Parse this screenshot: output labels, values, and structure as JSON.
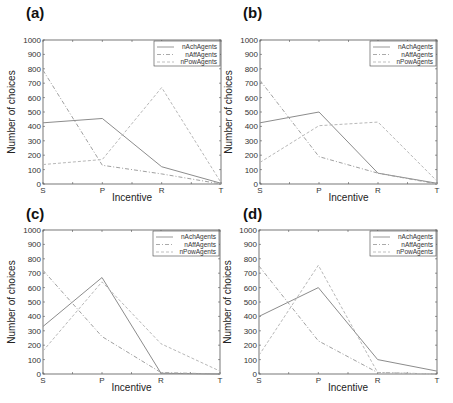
{
  "figure": {
    "panels": [
      "(a)",
      "(b)",
      "(c)",
      "(d)"
    ]
  },
  "chart_data": [
    {
      "panel": "(a)",
      "type": "line",
      "title": "",
      "xlabel": "Incentive",
      "ylabel": "Number of choices",
      "categories": [
        "S",
        "P",
        "R",
        "T"
      ],
      "ylim": [
        0,
        1000
      ],
      "yticks": [
        0,
        100,
        200,
        300,
        400,
        500,
        600,
        700,
        800,
        900,
        1000
      ],
      "grid": false,
      "legend_position": "upper right",
      "series": [
        {
          "name": "nAchAgents",
          "style": "solid",
          "values": [
            425,
            455,
            120,
            5
          ]
        },
        {
          "name": "nAffAgents",
          "style": "dash-dot",
          "values": [
            790,
            130,
            70,
            0
          ]
        },
        {
          "name": "nPowAgents",
          "style": "dashed",
          "values": [
            135,
            170,
            670,
            10
          ]
        }
      ]
    },
    {
      "panel": "(b)",
      "type": "line",
      "title": "",
      "xlabel": "Incentive",
      "ylabel": "Number of choices",
      "categories": [
        "S",
        "P",
        "R",
        "T"
      ],
      "ylim": [
        0,
        1000
      ],
      "yticks": [
        0,
        100,
        200,
        300,
        400,
        500,
        600,
        700,
        800,
        900,
        1000
      ],
      "grid": false,
      "legend_position": "upper right",
      "series": [
        {
          "name": "nAchAgents",
          "style": "solid",
          "values": [
            425,
            500,
            75,
            5
          ]
        },
        {
          "name": "nAffAgents",
          "style": "dash-dot",
          "values": [
            720,
            190,
            75,
            0
          ]
        },
        {
          "name": "nPowAgents",
          "style": "dashed",
          "values": [
            150,
            405,
            430,
            20
          ]
        }
      ]
    },
    {
      "panel": "(c)",
      "type": "line",
      "title": "",
      "xlabel": "Incentive",
      "ylabel": "Number of choices",
      "categories": [
        "S",
        "P",
        "R",
        "T"
      ],
      "ylim": [
        0,
        1000
      ],
      "yticks": [
        0,
        100,
        200,
        300,
        400,
        500,
        600,
        700,
        800,
        900,
        1000
      ],
      "grid": false,
      "legend_position": "upper right",
      "series": [
        {
          "name": "nAchAgents",
          "style": "solid",
          "values": [
            330,
            670,
            5,
            0
          ]
        },
        {
          "name": "nAffAgents",
          "style": "dash-dot",
          "values": [
            720,
            260,
            10,
            0
          ]
        },
        {
          "name": "nPowAgents",
          "style": "dashed",
          "values": [
            160,
            640,
            210,
            20
          ]
        }
      ]
    },
    {
      "panel": "(d)",
      "type": "line",
      "title": "",
      "xlabel": "Incentive",
      "ylabel": "Number of choices",
      "categories": [
        "S",
        "P",
        "R",
        "T"
      ],
      "ylim": [
        0,
        1000
      ],
      "yticks": [
        0,
        100,
        200,
        300,
        400,
        500,
        600,
        700,
        800,
        900,
        1000
      ],
      "grid": false,
      "legend_position": "upper right",
      "series": [
        {
          "name": "nAchAgents",
          "style": "solid",
          "values": [
            400,
            600,
            100,
            20
          ]
        },
        {
          "name": "nAffAgents",
          "style": "dash-dot",
          "values": [
            750,
            230,
            10,
            0
          ]
        },
        {
          "name": "nPowAgents",
          "style": "dashed",
          "values": [
            130,
            755,
            10,
            0
          ]
        }
      ]
    }
  ],
  "colors": {
    "axis": "#555555",
    "nAchAgents": "#8c8c8c",
    "nAffAgents": "#a0a0a0",
    "nPowAgents": "#b8b8b8"
  }
}
